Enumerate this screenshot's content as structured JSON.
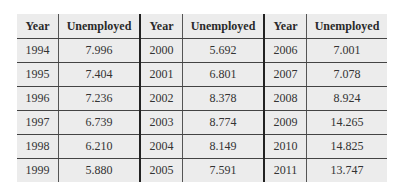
{
  "table": {
    "headers": [
      "Year",
      "Unemployed",
      "Year",
      "Unemployed",
      "Year",
      "Unemployed"
    ],
    "rows": [
      [
        "1994",
        "7.996",
        "2000",
        "5.692",
        "2006",
        "7.001"
      ],
      [
        "1995",
        "7.404",
        "2001",
        "6.801",
        "2007",
        "7.078"
      ],
      [
        "1996",
        "7.236",
        "2002",
        "8.378",
        "2008",
        "8.924"
      ],
      [
        "1997",
        "6.739",
        "2003",
        "8.774",
        "2009",
        "14.265"
      ],
      [
        "1998",
        "6.210",
        "2004",
        "8.149",
        "2010",
        "14.825"
      ],
      [
        "1999",
        "5.880",
        "2005",
        "7.591",
        "2011",
        "13.747"
      ]
    ]
  }
}
